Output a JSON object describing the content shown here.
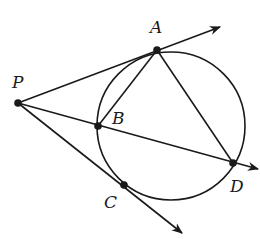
{
  "diagram": {
    "type": "geometry",
    "colors": {
      "stroke": "#1a1a1a",
      "background": "#ffffff"
    },
    "circle": {
      "cx": 171,
      "cy": 126,
      "r": 74
    },
    "points": [
      {
        "id": "P",
        "label": "P",
        "x": 18,
        "y": 103,
        "label_x": 12,
        "label_y": 88
      },
      {
        "id": "A",
        "label": "A",
        "x": 157,
        "y": 50,
        "label_x": 150,
        "label_y": 33
      },
      {
        "id": "B",
        "label": "B",
        "x": 98,
        "y": 126,
        "label_x": 112,
        "label_y": 124
      },
      {
        "id": "C",
        "label": "C",
        "x": 124,
        "y": 185,
        "label_x": 104,
        "label_y": 208
      },
      {
        "id": "D",
        "label": "D",
        "x": 233,
        "y": 163,
        "label_x": 230,
        "label_y": 192
      }
    ],
    "rays": [
      {
        "name": "tangent-PA",
        "from": "P",
        "through": "A",
        "end": [
          220,
          27
        ]
      },
      {
        "name": "secant-PBD",
        "from": "P",
        "through": "D",
        "end": [
          258,
          169
        ]
      },
      {
        "name": "tangent-PC",
        "from": "P",
        "through": "C",
        "end": [
          182,
          233
        ]
      }
    ],
    "segments": [
      {
        "name": "chord-AB",
        "from": "A",
        "to": "B"
      },
      {
        "name": "chord-AD",
        "from": "A",
        "to": "D"
      }
    ]
  }
}
